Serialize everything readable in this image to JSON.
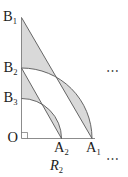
{
  "figure": {
    "caption": {
      "base": "R",
      "sub": "2"
    },
    "points": {
      "b1": {
        "base": "B",
        "sub": "1"
      },
      "b2": {
        "base": "B",
        "sub": "2"
      },
      "b3": {
        "base": "B",
        "sub": "3"
      },
      "o": {
        "base": "O",
        "sub": ""
      },
      "a2": {
        "base": "A",
        "sub": "2"
      },
      "a1": {
        "base": "A",
        "sub": "1"
      }
    },
    "ellipsis": {
      "mid": "⋯",
      "bottom": "⋯"
    },
    "colors": {
      "background": "#ffffff",
      "shade": "#d9d9d9",
      "curve": "#565656",
      "axis": "#6e6e6e",
      "label": "#1c1c1c",
      "ellipsis": "#4d4d4d"
    }
  }
}
